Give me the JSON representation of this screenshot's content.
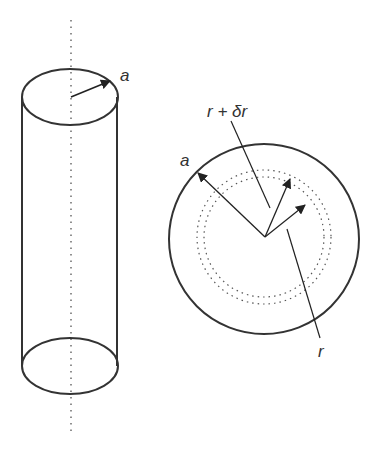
{
  "diagram": {
    "cylinder": {
      "radius_label": "a",
      "axis_style": "dotted"
    },
    "cross_section": {
      "outer_radius_label": "a",
      "shell_outer_label": "r + δr",
      "shell_inner_label": "r"
    },
    "colors": {
      "stroke": "#333333",
      "dotted": "#555555",
      "background": "#ffffff"
    }
  }
}
